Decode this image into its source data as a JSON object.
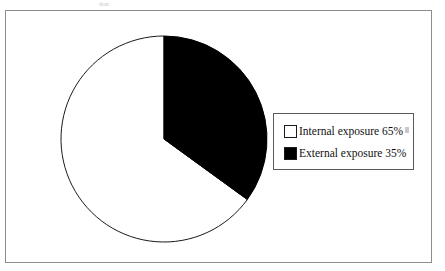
{
  "figure": {
    "frame_border_color": "#8d8d8d",
    "background": "#ffffff",
    "scan_artifact_text": "tion"
  },
  "legend": {
    "position": "right-middle",
    "border_color": "#5a5a5a",
    "entries": [
      {
        "label": "Internal exposure 65%",
        "swatch_fill": "#ffffff",
        "swatch_stroke": "#1a1a1a",
        "icon": "legend-swatch-white"
      },
      {
        "label": "External exposure 35%",
        "swatch_fill": "#000000",
        "swatch_stroke": "#1a1a1a",
        "icon": "legend-swatch-black"
      }
    ]
  },
  "chart_data": {
    "type": "pie",
    "title": "",
    "subtitle": "",
    "xlabel": "",
    "ylabel": "",
    "grid": false,
    "legend_position": "right",
    "start_angle_deg": 0,
    "direction": "clockwise",
    "center_px": [
      104,
      119
    ],
    "radius_px": 103,
    "labels": [
      "Internal exposure",
      "External exposure"
    ],
    "values": [
      65,
      35
    ],
    "value_unit": "%",
    "slices": [
      {
        "name": "Internal exposure",
        "value": 65,
        "display": "65%",
        "color": "#ffffff",
        "stroke": "#1a1a1a",
        "sweep_deg": 234
      },
      {
        "name": "External exposure",
        "value": 35,
        "display": "35%",
        "color": "#000000",
        "stroke": "#000000",
        "sweep_deg": 126
      }
    ],
    "annotations": []
  }
}
